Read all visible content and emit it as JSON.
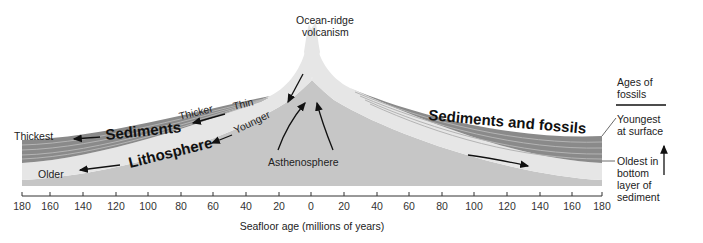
{
  "diagram": {
    "title": "Ocean-ridge volcanism",
    "labels": {
      "ridge_line1": "Ocean-ridge",
      "ridge_line2": "volcanism",
      "thickest": "Thickest",
      "thicker": "Thicker",
      "thin": "Thin",
      "sediments": "Sediments",
      "younger": "Younger",
      "lithosphere": "Lithosphere",
      "older": "Older",
      "asthenosphere": "Asthenosphere",
      "sediments_and_fossils": "Sediments and fossils"
    },
    "legend": {
      "title_line1": "Ages of",
      "title_line2": "fossils",
      "youngest_line1": "Youngest",
      "youngest_line2": "at surface",
      "oldest_line1": "Oldest in",
      "oldest_line2": "bottom",
      "oldest_line3": "layer of",
      "oldest_line4": "sediment"
    },
    "axis": {
      "label": "Seafloor age (millions of years)",
      "ticks": [
        "180",
        "160",
        "140",
        "120",
        "100",
        "80",
        "60",
        "40",
        "20",
        "0",
        "20",
        "40",
        "60",
        "80",
        "100",
        "120",
        "140",
        "160",
        "180"
      ]
    },
    "colors": {
      "sediment_dark": "#7d7d7d",
      "sediment_light": "#a8a8a8",
      "lithosphere": "#e4e4e4",
      "asthenosphere": "#c4c4c4",
      "text": "#222222"
    }
  }
}
